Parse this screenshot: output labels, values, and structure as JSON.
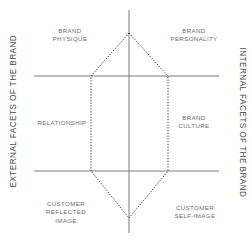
{
  "diagram": {
    "type": "brand-identity-prism",
    "side_labels": {
      "left": "EXTERNAL FACETS OF THE BRAND",
      "right": "INTERNAL FACETS OF THE BRAND"
    },
    "facets": {
      "top_left": "BRAND\nPHYSIQUE",
      "top_right": "BRAND\nPERSONALITY",
      "middle_left": "RELATIONSHIP",
      "middle_right": "BRAND\nCULTURE",
      "bottom_left": "CUSTOMER\nREFLECTED\nIMAGE",
      "bottom_right": "CUSTOMER\nSELF-IMAGE"
    },
    "colors": {
      "axis_line": "#7d7d7d",
      "hexagon_outline": "#3c3c3c",
      "facet_text": "#6e6e6e",
      "side_text": "#4a4a4a",
      "background": "#ffffff"
    }
  }
}
